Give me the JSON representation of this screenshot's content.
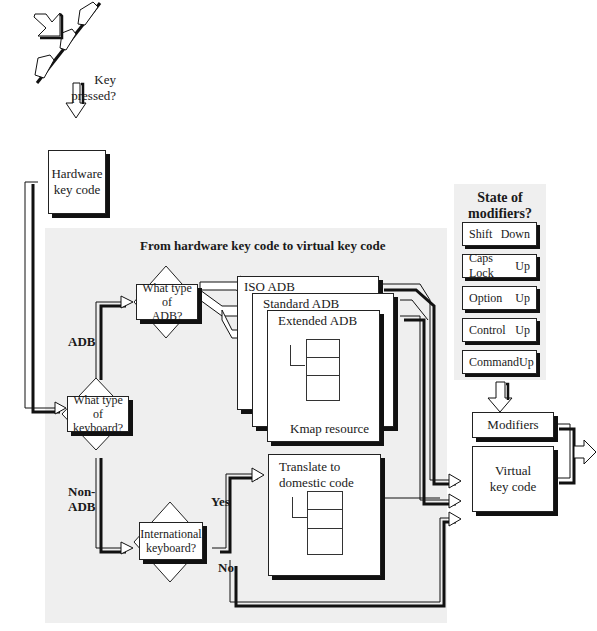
{
  "diagram": {
    "start": {
      "label": "Key pressed?"
    },
    "hardware_box": {
      "label_line1": "Hardware",
      "label_line2": "key code"
    },
    "panel": {
      "title": "From hardware key code to virtual key code"
    },
    "decisions": {
      "keyboard_type": {
        "line1": "What type of",
        "line2": "keyboard?"
      },
      "adb_type": {
        "line1": "What type of",
        "line2": "ADB?"
      },
      "international": {
        "line1": "International",
        "line2": "keyboard?"
      }
    },
    "branch_labels": {
      "adb": "ADB",
      "non_adb_line1": "Non-",
      "non_adb_line2": "ADB",
      "yes": "Yes",
      "no": "No"
    },
    "kmap_pages": {
      "iso": "ISO ADB",
      "standard": "Standard ADB",
      "extended": "Extended ADB",
      "resource_label": "Kmap resource"
    },
    "translate_box": {
      "line1": "Translate to",
      "line2": "domestic code"
    },
    "modifiers_panel": {
      "title_line1": "State of",
      "title_line2": "modifiers?",
      "items": [
        {
          "name": "Shift",
          "state": "Down"
        },
        {
          "name": "Caps Lock",
          "state": "Up"
        },
        {
          "name": "Option",
          "state": "Up"
        },
        {
          "name": "Control",
          "state": "Up"
        },
        {
          "name": "Command",
          "state": "Up"
        }
      ]
    },
    "outputs": {
      "modifiers": "Modifiers",
      "virtual_line1": "Virtual",
      "virtual_line2": "key code"
    }
  }
}
